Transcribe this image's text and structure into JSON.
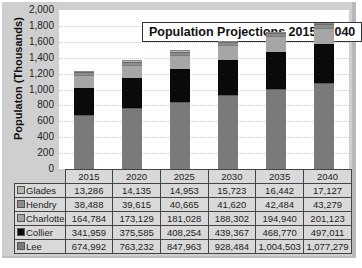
{
  "chart_data": {
    "type": "bar",
    "stacked": true,
    "title": "Population Projections 2015 - 2040",
    "xlabel": "",
    "ylabel": "Populaton (Thousands)",
    "ylim": [
      0,
      2000
    ],
    "yticks": [
      "2,000",
      "1,800",
      "1,600",
      "1,400",
      "1,200",
      "1,000",
      "800",
      "600",
      "400",
      "200",
      "0"
    ],
    "grid": true,
    "legend_position": "data-table",
    "categories": [
      "2015",
      "2020",
      "2025",
      "2030",
      "2035",
      "2040"
    ],
    "series": [
      {
        "name": "Lee",
        "color": "#7a7a7a",
        "values": [
          674992,
          763232,
          847963,
          928484,
          1004503,
          1077279
        ],
        "labels": [
          "674,992",
          "763,232",
          "847,963",
          "928,484",
          "1,004,503",
          "1,077,279"
        ]
      },
      {
        "name": "Collier",
        "color": "#0a0a0a",
        "values": [
          341959,
          375585,
          408254,
          439367,
          468770,
          497011
        ],
        "labels": [
          "341,959",
          "375,585",
          "408,254",
          "439,367",
          "468,770",
          "497,011"
        ]
      },
      {
        "name": "Charlotte",
        "color": "#a6a6a6",
        "values": [
          164784,
          173129,
          181028,
          188302,
          194940,
          201123
        ],
        "labels": [
          "164,784",
          "173,129",
          "181,028",
          "188,302",
          "194,940",
          "201,123"
        ]
      },
      {
        "name": "Hendry",
        "color": "#8c8c8c",
        "values": [
          38488,
          39615,
          40665,
          41620,
          42484,
          43279
        ],
        "labels": [
          "38,488",
          "39,615",
          "40,665",
          "41,620",
          "42,484",
          "43,279"
        ]
      },
      {
        "name": "Glades",
        "color": "#b5b5b5",
        "values": [
          13286,
          14135,
          14953,
          15723,
          16442,
          17127
        ],
        "labels": [
          "13,286",
          "14,135",
          "14,953",
          "15,723",
          "16,442",
          "17,127"
        ]
      }
    ],
    "table_row_order": [
      "Glades",
      "Hendry",
      "Charlotte",
      "Collier",
      "Lee"
    ]
  }
}
